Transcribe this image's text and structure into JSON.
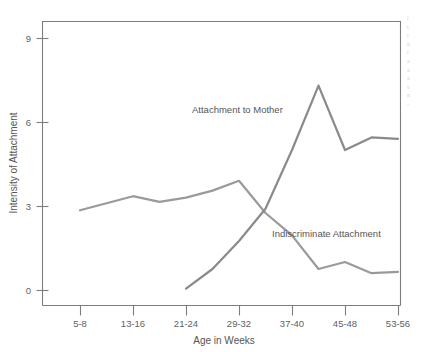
{
  "figure": {
    "background": "#ffffff",
    "axis_color": "#7d7d7d",
    "text_color": "#555555"
  },
  "chart_data": {
    "type": "line",
    "title": "",
    "xlabel": "Age in Weeks",
    "ylabel": "Intensity of Attachment",
    "categories": [
      "5-8",
      "9-12",
      "13-16",
      "17-20",
      "21-24",
      "25-28",
      "29-32",
      "33-36",
      "37-40",
      "41-44",
      "45-48",
      "49-52",
      "53-56"
    ],
    "xtick_labels": [
      "5-8",
      "13-16",
      "21-24",
      "29-32",
      "37-40",
      "45-48",
      "53-56"
    ],
    "ytick_labels": [
      "0",
      "3",
      "6",
      "9"
    ],
    "ytick_values": [
      0,
      3,
      6,
      9
    ],
    "ylim": [
      -0.55,
      9.6
    ],
    "grid": false,
    "legend": "inline-annotations",
    "series": [
      {
        "name": "Indiscriminate Attachment",
        "color": "#9a9a9a",
        "x": [
          "5-8",
          "9-12",
          "13-16",
          "17-20",
          "21-24",
          "25-28",
          "29-32",
          "33-36",
          "37-40",
          "41-44",
          "45-48",
          "49-52",
          "53-56"
        ],
        "values": [
          2.85,
          3.1,
          3.35,
          3.15,
          3.3,
          3.55,
          3.9,
          2.75,
          1.95,
          0.75,
          1.0,
          0.6,
          0.65
        ]
      },
      {
        "name": "Attachment to Mother",
        "color": "#8a8a8a",
        "x": [
          "21-24",
          "25-28",
          "29-32",
          "33-36",
          "37-40",
          "41-44",
          "45-48",
          "49-52",
          "53-56"
        ],
        "values": [
          0.05,
          0.75,
          1.75,
          2.9,
          5.0,
          7.3,
          5.0,
          5.45,
          5.4
        ]
      }
    ],
    "annotations": [
      {
        "text": "Attachment to Mother",
        "x_px": 192,
        "y_px": 113
      },
      {
        "text": "Indiscriminate Attachment",
        "x_px": 272,
        "y_px": 237
      }
    ]
  },
  "margin_text": {
    "lines": [
      "i",
      "t",
      "r",
      "n",
      "r",
      "a",
      "a",
      "a",
      "s",
      "n",
      "-"
    ]
  }
}
